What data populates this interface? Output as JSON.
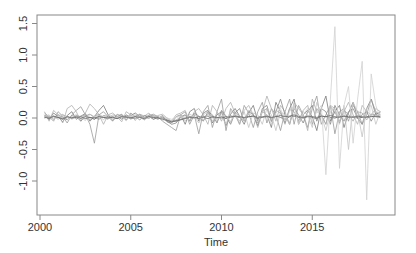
{
  "chart_data": {
    "type": "line",
    "title": "",
    "xlabel": "Time",
    "ylabel": "",
    "xlim": [
      2000,
      2019.2
    ],
    "ylim": [
      -1.5,
      1.6
    ],
    "x_ticks": [
      2000,
      2005,
      2010,
      2015
    ],
    "x_tick_labels": [
      "2000",
      "2005",
      "2010",
      "2015"
    ],
    "y_ticks": [
      -1.0,
      -0.5,
      0.0,
      0.5,
      1.0,
      1.5
    ],
    "y_tick_labels": [
      "-1.0",
      "-0.5",
      "0.0",
      "0.5",
      "1.0",
      "1.5"
    ],
    "grid": false,
    "legend": null,
    "frequency": "quarterly",
    "start": 2000.25,
    "series": [
      {
        "name": "series1",
        "color": "#555555",
        "values": [
          0.02,
          -0.01,
          0.03,
          0.01,
          -0.02,
          0.02,
          0.0,
          0.03,
          -0.01,
          0.02,
          0.01,
          -0.02,
          0.03,
          0.01,
          0.0,
          0.02,
          -0.01,
          0.03,
          0.02,
          0.0,
          -0.01,
          0.02,
          0.01,
          0.03,
          -0.02,
          0.01,
          0.0,
          -0.03,
          -0.05,
          -0.04,
          -0.02,
          0.0,
          0.02,
          0.01,
          -0.01,
          0.02,
          0.03,
          0.01,
          0.0,
          0.02,
          -0.01,
          0.03,
          0.02,
          0.01,
          0.0,
          0.02,
          0.03,
          -0.01,
          0.01,
          0.02,
          0.0,
          0.03,
          0.01,
          -0.02,
          0.02,
          0.03,
          0.01,
          0.0,
          0.02,
          0.01,
          -0.01,
          0.03,
          0.02,
          0.01,
          0.0,
          0.02,
          0.03,
          0.01,
          0.02,
          0.0,
          0.01,
          0.02,
          0.03,
          0.02,
          0.01
        ]
      },
      {
        "name": "series2",
        "color": "#7a7a7a",
        "values": [
          0.05,
          -0.03,
          0.08,
          0.02,
          -0.06,
          0.04,
          0.1,
          -0.02,
          0.03,
          0.07,
          -0.05,
          0.02,
          0.12,
          0.2,
          0.05,
          -0.04,
          0.02,
          0.06,
          -0.03,
          0.04,
          0.08,
          0.02,
          -0.02,
          0.05,
          0.03,
          -0.01,
          0.04,
          -0.06,
          -0.08,
          0.02,
          0.05,
          -0.1,
          0.1,
          0.15,
          -0.05,
          0.08,
          0.12,
          -0.08,
          0.05,
          0.1,
          -0.12,
          0.06,
          0.15,
          0.03,
          -0.1,
          0.08,
          0.2,
          -0.05,
          0.1,
          0.05,
          -0.15,
          0.25,
          0.1,
          -0.08,
          0.15,
          0.3,
          -0.1,
          0.05,
          0.12,
          0.02,
          -0.2,
          0.15,
          0.35,
          -0.05,
          0.1,
          0.2,
          -0.15,
          0.08,
          0.25,
          0.0,
          -0.1,
          0.15,
          0.3,
          0.05,
          0.1
        ]
      },
      {
        "name": "series3",
        "color": "#9a9a9a",
        "values": [
          0.08,
          0.02,
          -0.05,
          0.1,
          0.03,
          -0.08,
          0.05,
          0.12,
          0.18,
          0.05,
          -0.1,
          -0.4,
          0.05,
          0.1,
          0.02,
          -0.05,
          0.06,
          0.03,
          -0.04,
          0.08,
          0.02,
          0.05,
          -0.03,
          0.04,
          0.06,
          0.02,
          -0.05,
          -0.1,
          -0.15,
          -0.2,
          0.05,
          0.1,
          -0.1,
          0.05,
          -0.25,
          0.1,
          0.2,
          -0.15,
          0.1,
          0.3,
          -0.2,
          0.15,
          0.05,
          -0.1,
          0.2,
          0.08,
          -0.15,
          0.1,
          0.25,
          -0.08,
          0.15,
          0.05,
          -0.2,
          0.1,
          0.3,
          -0.1,
          0.2,
          0.05,
          -0.15,
          0.15,
          0.35,
          -0.1,
          0.05,
          0.2,
          -0.25,
          0.1,
          0.15,
          -0.05,
          0.2,
          0.1,
          -0.1,
          0.05,
          0.3,
          0.1,
          0.05
        ]
      },
      {
        "name": "series4",
        "color": "#b0b0b0",
        "values": [
          0.1,
          -0.05,
          0.12,
          0.05,
          -0.08,
          0.15,
          0.2,
          0.1,
          -0.05,
          0.08,
          0.22,
          0.15,
          0.05,
          -0.1,
          0.05,
          0.08,
          0.02,
          -0.06,
          0.1,
          0.05,
          -0.04,
          0.06,
          0.03,
          0.08,
          -0.02,
          0.04,
          0.06,
          0.0,
          -0.05,
          0.05,
          0.08,
          0.12,
          -0.05,
          0.1,
          0.15,
          0.05,
          -0.1,
          0.2,
          0.1,
          -0.05,
          0.15,
          0.25,
          0.08,
          -0.1,
          0.12,
          0.2,
          0.05,
          -0.15,
          0.1,
          0.35,
          0.15,
          -0.05,
          0.2,
          0.1,
          -0.1,
          0.25,
          0.15,
          0.05,
          -0.2,
          0.3,
          0.1,
          0.05,
          -0.1,
          0.2,
          0.15,
          -0.05,
          0.1,
          0.25,
          0.05,
          -0.1,
          0.2,
          0.1,
          0.05,
          0.15,
          0.1
        ]
      },
      {
        "name": "series5",
        "color": "#888888",
        "values": [
          0.0,
          0.03,
          -0.02,
          0.05,
          0.01,
          -0.03,
          0.04,
          0.02,
          -0.05,
          0.03,
          0.06,
          0.01,
          -0.02,
          0.04,
          0.02,
          0.0,
          0.03,
          -0.02,
          0.05,
          0.01,
          0.02,
          -0.03,
          0.04,
          0.02,
          0.01,
          -0.02,
          0.03,
          -0.05,
          -0.1,
          -0.08,
          0.02,
          0.05,
          -0.05,
          0.08,
          0.03,
          -0.05,
          0.1,
          0.05,
          -0.08,
          0.12,
          0.02,
          -0.1,
          0.08,
          0.15,
          -0.05,
          0.1,
          0.05,
          -0.12,
          0.15,
          0.2,
          -0.05,
          0.1,
          0.3,
          0.05,
          -0.1,
          0.15,
          0.05,
          -0.08,
          0.1,
          0.2,
          -0.05,
          0.15,
          0.1,
          -0.1,
          0.2,
          0.05,
          -0.05,
          0.1,
          0.15,
          0.0,
          0.05,
          0.1,
          -0.05,
          0.08,
          0.05
        ]
      },
      {
        "name": "series6",
        "color": "#c4c4c4",
        "values": [
          0.02,
          0.05,
          -0.03,
          0.04,
          0.06,
          -0.02,
          0.03,
          0.05,
          0.01,
          -0.04,
          0.06,
          0.02,
          0.04,
          -0.03,
          0.05,
          0.02,
          0.0,
          0.04,
          -0.02,
          0.03,
          0.05,
          0.01,
          -0.03,
          0.04,
          0.02,
          0.03,
          -0.04,
          0.0,
          -0.06,
          0.02,
          0.04,
          -0.05,
          0.06,
          0.02,
          -0.08,
          0.05,
          0.1,
          -0.05,
          0.08,
          0.02,
          -0.1,
          0.12,
          0.05,
          -0.05,
          0.1,
          -0.15,
          0.08,
          0.05,
          -0.1,
          0.15,
          0.05,
          -0.2,
          0.1,
          0.05,
          -0.1,
          0.2,
          -0.05,
          0.1,
          0.05,
          -0.15,
          0.25,
          0.05,
          -0.2,
          0.1,
          0.15,
          -0.1,
          0.2,
          -0.5,
          0.25,
          0.1,
          -0.3,
          0.15,
          0.2,
          -0.1,
          0.1
        ]
      },
      {
        "name": "series7",
        "color": "#a8a8a8",
        "values": [
          0.04,
          0.01,
          0.03,
          -0.02,
          0.05,
          0.02,
          -0.01,
          0.04,
          0.02,
          0.05,
          -0.03,
          0.03,
          0.06,
          0.01,
          -0.02,
          0.05,
          0.03,
          0.0,
          0.04,
          -0.02,
          0.03,
          0.06,
          0.01,
          -0.01,
          0.04,
          0.02,
          0.0,
          -0.04,
          -0.07,
          -0.03,
          0.01,
          0.04,
          -0.03,
          0.06,
          0.02,
          -0.04,
          0.07,
          0.03,
          -0.06,
          0.09,
          0.04,
          -0.07,
          0.1,
          0.02,
          -0.05,
          0.12,
          0.06,
          -0.08,
          0.1,
          0.15,
          -0.06,
          0.12,
          0.08,
          -0.1,
          0.15,
          0.1,
          -0.05,
          0.12,
          0.2,
          -0.1,
          0.15,
          0.05,
          -0.1,
          0.18,
          0.1,
          -0.08,
          0.12,
          0.06,
          -0.05,
          0.1,
          0.08,
          -0.03,
          0.06,
          0.05,
          0.03
        ]
      },
      {
        "name": "series8",
        "color": "#d0d0d0",
        "values": [
          0.0,
          0.02,
          -0.01,
          0.03,
          0.0,
          0.02,
          -0.02,
          0.01,
          0.03,
          0.0,
          -0.01,
          0.02,
          0.01,
          0.03,
          0.0,
          -0.02,
          0.02,
          0.01,
          0.0,
          0.03,
          -0.01,
          0.02,
          0.0,
          0.01,
          0.02,
          -0.01,
          0.03,
          0.0,
          -0.02,
          0.01,
          0.02,
          0.0,
          -0.03,
          0.05,
          0.02,
          -0.02,
          0.04,
          0.0,
          -0.03,
          0.05,
          0.02,
          -0.05,
          0.06,
          0.03,
          -0.04,
          0.08,
          0.02,
          -0.06,
          0.1,
          0.05,
          -0.1,
          0.08,
          0.15,
          -0.05,
          0.1,
          0.2,
          -0.1,
          0.05,
          0.15,
          -0.05,
          0.1,
          0.2,
          -0.9,
          0.3,
          1.45,
          -0.8,
          0.2,
          0.5,
          -0.4,
          0.3,
          0.9,
          -1.3,
          0.7,
          0.2,
          0.0
        ]
      },
      {
        "name": "series9",
        "color": "#6a6a6a",
        "values": [
          0.01,
          0.0,
          0.02,
          0.01,
          -0.01,
          0.02,
          0.0,
          0.01,
          0.02,
          -0.01,
          0.01,
          0.0,
          0.02,
          0.01,
          0.0,
          0.01,
          -0.01,
          0.02,
          0.01,
          0.0,
          0.02,
          0.01,
          -0.01,
          0.02,
          0.01,
          0.0,
          -0.02,
          -0.04,
          -0.06,
          -0.05,
          -0.03,
          -0.01,
          0.01,
          0.0,
          0.02,
          0.01,
          -0.01,
          0.02,
          0.01,
          0.0,
          0.02,
          0.01,
          0.03,
          0.02,
          0.01,
          0.02,
          0.03,
          0.01,
          0.02,
          0.03,
          0.01,
          0.02,
          0.04,
          0.02,
          0.03,
          0.05,
          0.02,
          0.01,
          0.03,
          0.02,
          0.01,
          0.03,
          0.02,
          0.04,
          0.02,
          0.01,
          0.03,
          0.02,
          0.01,
          0.03,
          0.02,
          0.01,
          0.02,
          0.03,
          0.02
        ]
      }
    ]
  }
}
